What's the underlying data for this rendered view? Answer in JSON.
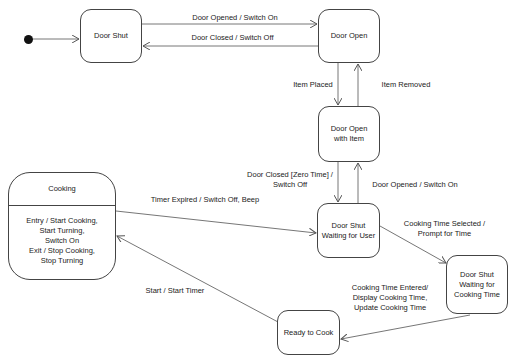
{
  "diagram": {
    "type": "state-machine",
    "states": {
      "door_shut": "Door Shut",
      "door_open": "Door Open",
      "door_open_with_item": "Door Open\nwith Item",
      "cooking": {
        "name": "Cooking",
        "activities": "Entry / Start Cooking,\nStart Turning,\nSwitch On\nExit / Stop Cooking,\nStop Turning"
      },
      "door_shut_waiting_user": "Door Shut\nWaiting for User",
      "door_shut_waiting_time": "Door Shut\nWaiting for\nCooking Time",
      "ready_to_cook": "Ready to Cook"
    },
    "transitions": {
      "shut_to_open": "Door Opened / Switch On",
      "open_to_shut": "Door Closed / Switch Off",
      "item_placed": "Item Placed",
      "item_removed": "Item Removed",
      "closed_zero_time": "Door Closed [Zero Time] /\nSwitch Off",
      "opened_switch_on": "Door Opened / Switch On",
      "timer_expired": "Timer Expired / Switch Off, Beep",
      "time_selected": "Cooking Time Selected /\nPrompt for Time",
      "time_entered": "Cooking Time Entered/\nDisplay Cooking Time,\nUpdate Cooking Time",
      "start": "Start / Start Timer"
    }
  }
}
